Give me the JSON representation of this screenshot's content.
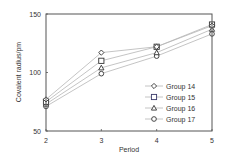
{
  "chart_data": {
    "type": "line",
    "title": "",
    "xlabel": "Period",
    "ylabel": "Covalent radius/pm",
    "x": [
      2,
      3,
      4,
      5
    ],
    "x_tick_labels": [
      "2",
      "3",
      "4",
      "5"
    ],
    "y_tick_labels": [
      "50",
      "100",
      "150"
    ],
    "y_ticks": [
      50,
      100,
      150
    ],
    "ylim": [
      50,
      150
    ],
    "xlim": [
      2,
      5
    ],
    "grid": false,
    "legend_position": "lower right inside",
    "series": [
      {
        "name": "Group 14",
        "marker": "diamond",
        "values": [
          77,
          117,
          122,
          140
        ]
      },
      {
        "name": "Group 15",
        "marker": "square",
        "values": [
          75,
          110,
          122,
          141
        ]
      },
      {
        "name": "Group 16",
        "marker": "triangle",
        "values": [
          73,
          104,
          117,
          137
        ]
      },
      {
        "name": "Group 17",
        "marker": "circle",
        "values": [
          71,
          99,
          114,
          133
        ]
      }
    ]
  },
  "colors": {
    "line": "#b5b5b5",
    "marker": "#333333",
    "frame": "#555555",
    "legend_square": "#3a3a6a"
  }
}
